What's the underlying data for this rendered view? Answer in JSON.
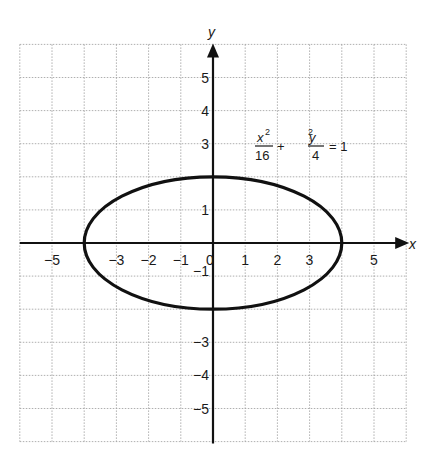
{
  "chart_data": {
    "type": "line",
    "title": "",
    "xlabel": "x",
    "ylabel": "y",
    "xlim": [
      -6,
      6
    ],
    "ylim": [
      -6,
      6
    ],
    "grid": true,
    "grid_style": "dotted",
    "x_tick_labels": [
      {
        "value": -5,
        "label": "−5"
      },
      {
        "value": -3,
        "label": "−3"
      },
      {
        "value": -2,
        "label": "−2"
      },
      {
        "value": -1,
        "label": "−1"
      },
      {
        "value": 0,
        "label": "0"
      },
      {
        "value": 1,
        "label": "1"
      },
      {
        "value": 2,
        "label": "2"
      },
      {
        "value": 3,
        "label": "3"
      },
      {
        "value": 5,
        "label": "5"
      }
    ],
    "y_tick_labels": [
      {
        "value": 5,
        "label": "5"
      },
      {
        "value": 4,
        "label": "4"
      },
      {
        "value": 3,
        "label": "3"
      },
      {
        "value": 1,
        "label": "1"
      },
      {
        "value": -1,
        "label": "−1"
      },
      {
        "value": -3,
        "label": "−3"
      },
      {
        "value": -4,
        "label": "−4"
      },
      {
        "value": -5,
        "label": "−5"
      }
    ],
    "series": [
      {
        "name": "ellipse",
        "equation": "x^2/16 + y^2/4 = 1",
        "center": [
          0,
          0
        ],
        "semi_major_x": 4,
        "semi_minor_y": 2,
        "key_points": [
          [
            4,
            0
          ],
          [
            0,
            2
          ],
          [
            -4,
            0
          ],
          [
            0,
            -2
          ]
        ],
        "color": "#111111"
      }
    ],
    "annotations": [
      {
        "text": "x²/16 + y²/4 = 1",
        "position": [
          2.8,
          3
        ],
        "parts": {
          "frac1_num": "x",
          "frac1_num_exp": "2",
          "frac1_den": "16",
          "plus": "+",
          "frac2_num": "y",
          "frac2_num_exp": "2",
          "frac2_den": "4",
          "equals": "= 1"
        }
      }
    ]
  },
  "axes": {
    "x_name": "x",
    "y_name": "y"
  }
}
